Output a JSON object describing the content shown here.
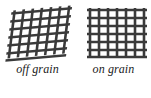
{
  "figure": {
    "kind": "fabric-grain-comparison-diagram",
    "background_color": "#ffffff",
    "line_color": "#3a3a3a",
    "text_color": "#1b1b1b"
  },
  "swatches": [
    {
      "id": "off-grain",
      "caption": "off grain",
      "alignment": "skewed",
      "skew_x_degrees": -7,
      "skew_y_degrees": -5,
      "warp_thread_count": 7,
      "weft_thread_count": 7,
      "thread_width_px": 2.6,
      "thread_color": "#3a3a3a"
    },
    {
      "id": "on-grain",
      "caption": "on grain",
      "alignment": "square",
      "skew_x_degrees": 0,
      "skew_y_degrees": 0,
      "warp_thread_count": 7,
      "weft_thread_count": 7,
      "thread_width_px": 2.6,
      "thread_color": "#3a3a3a"
    }
  ]
}
